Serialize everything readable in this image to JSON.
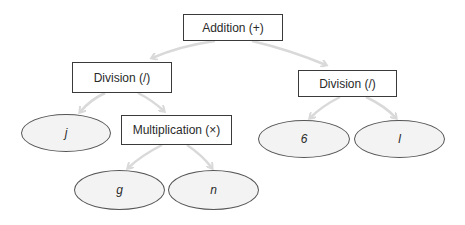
{
  "diagram": {
    "colors": {
      "edge": "#d9d9d9",
      "box_border": "#3a3a3a",
      "leaf_fill": "#f3f3f3",
      "leaf_border": "#555555",
      "text": "#2a2a2a"
    },
    "nodes": {
      "root": {
        "label": "Addition (+)",
        "type": "operator"
      },
      "left_div": {
        "label": "Division (/)",
        "type": "operator"
      },
      "right_div": {
        "label": "Division (/)",
        "type": "operator"
      },
      "mult": {
        "label": "Multiplication (×)",
        "type": "operator"
      },
      "leaf_j": {
        "label": "j",
        "type": "operand"
      },
      "leaf_g": {
        "label": "g",
        "type": "operand"
      },
      "leaf_n": {
        "label": "n",
        "type": "operand"
      },
      "leaf_6": {
        "label": "6",
        "type": "operand"
      },
      "leaf_l": {
        "label": "l",
        "type": "operand"
      }
    },
    "edges": [
      {
        "from": "root",
        "to": "left_div"
      },
      {
        "from": "root",
        "to": "right_div"
      },
      {
        "from": "left_div",
        "to": "leaf_j"
      },
      {
        "from": "left_div",
        "to": "mult"
      },
      {
        "from": "mult",
        "to": "leaf_g"
      },
      {
        "from": "mult",
        "to": "leaf_n"
      },
      {
        "from": "right_div",
        "to": "leaf_6"
      },
      {
        "from": "right_div",
        "to": "leaf_l"
      }
    ]
  }
}
